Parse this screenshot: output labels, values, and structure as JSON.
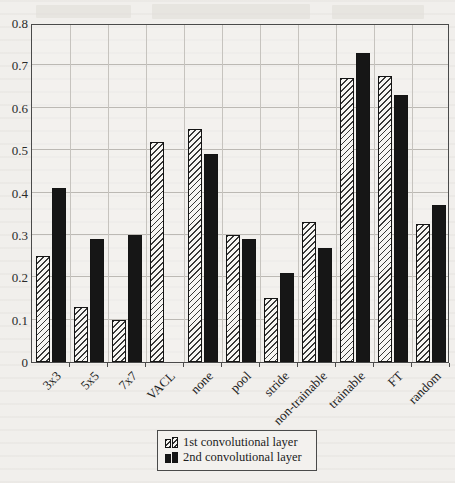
{
  "chart_data": {
    "type": "bar",
    "title": "",
    "xlabel": "",
    "ylabel": "",
    "categories": [
      "3x3",
      "5x5",
      "7x7",
      "VACL",
      "none",
      "pool",
      "stride",
      "non-trainable",
      "trainable",
      "FT",
      "random"
    ],
    "series": [
      {
        "name": "1st convolutional layer",
        "style": "hatched",
        "values": [
          0.25,
          0.13,
          0.1,
          0.52,
          0.55,
          0.3,
          0.15,
          0.33,
          0.67,
          0.675,
          0.325
        ]
      },
      {
        "name": "2nd convolutional layer",
        "style": "solid-black",
        "values": [
          0.41,
          0.29,
          0.3,
          null,
          0.49,
          0.29,
          0.21,
          0.27,
          0.73,
          0.63,
          0.37
        ]
      }
    ],
    "ylim": [
      0,
      0.8
    ],
    "ytick_step": 0.1,
    "ytick_labels": [
      "0",
      "0.1",
      "0.2",
      "0.3",
      "0.4",
      "0.5",
      "0.6",
      "0.7",
      "0.8"
    ],
    "grid": "both",
    "legend_position": "bottom-right"
  },
  "legend": {
    "items": [
      {
        "label": "1st convolutional layer",
        "swatch": "hatched"
      },
      {
        "label": "2nd convolutional layer",
        "swatch": "black"
      }
    ]
  },
  "colors": {
    "paper_background": "#f1efec",
    "bar_solid": "#161616",
    "bar_hatch_line": "#1e1e1e",
    "bar_hatch_bg": "#f7f6f3",
    "gridline": "#bcb9b4",
    "axis_frame": "#4a4a4a",
    "text": "#1c1c1c"
  }
}
